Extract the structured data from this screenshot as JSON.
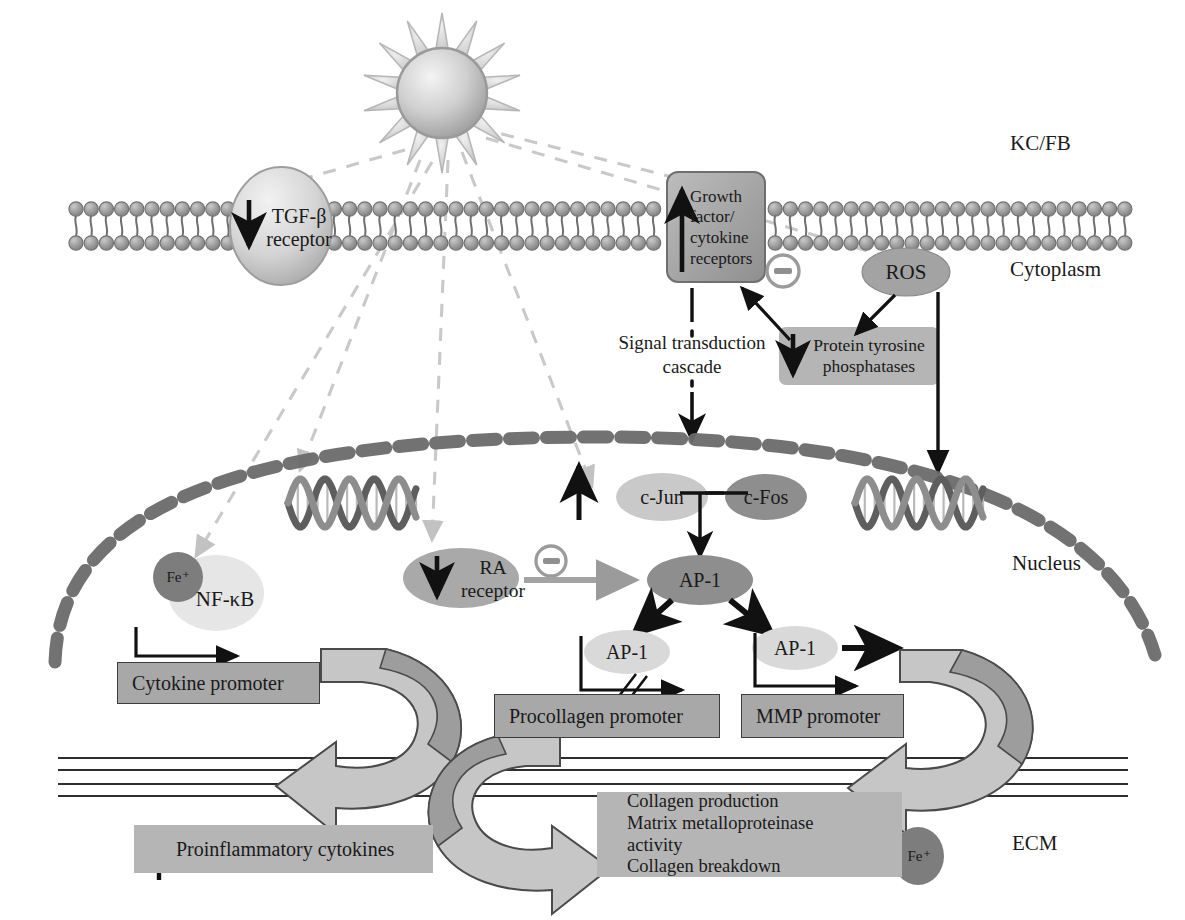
{
  "diagram": {
    "compartments": [
      {
        "id": "kcfb",
        "label": "KC/FB",
        "x": 1010,
        "y": 132
      },
      {
        "id": "cytoplasm",
        "label": "Cytoplasm",
        "x": 1010,
        "y": 258
      },
      {
        "id": "nucleus",
        "label": "Nucleus",
        "x": 1012,
        "y": 552
      },
      {
        "id": "ecm",
        "label": "ECM",
        "x": 1012,
        "y": 832
      }
    ],
    "sun": {
      "name": "uv-sun",
      "rays": 14
    },
    "membrane_receptors": [
      {
        "id": "tgfb",
        "label": "TGF-β\nreceptor",
        "lines": [
          "TGF-β",
          "receptor"
        ],
        "arrow": "down"
      },
      {
        "id": "gfr",
        "label": "Growth factor/cytokine receptors",
        "lines": [
          "Growth",
          "factor/",
          "cytokine",
          "receptors"
        ],
        "arrow": "up"
      }
    ],
    "cytoplasm_nodes": [
      {
        "id": "ros",
        "label": "ROS",
        "shape": "ellipse"
      },
      {
        "id": "ptp",
        "label": "Protein tyrosine phosphatases",
        "lines": [
          "Protein tyrosine",
          "phosphatases"
        ],
        "arrow": "down",
        "shape": "box"
      },
      {
        "id": "cascade",
        "label": "Signal transduction cascade",
        "lines": [
          "Signal transduction",
          "cascade"
        ],
        "shape": "text"
      }
    ],
    "nucleus_nodes": [
      {
        "id": "cjun",
        "label": "c-Jun",
        "arrow": "up"
      },
      {
        "id": "cfos",
        "label": "c-Fos"
      },
      {
        "id": "ap1_main",
        "label": "AP-1"
      },
      {
        "id": "ap1_left",
        "label": "AP-1"
      },
      {
        "id": "ap1_right",
        "label": "AP-1"
      },
      {
        "id": "ra",
        "label": "RA receptor",
        "lines": [
          "RA",
          "receptor"
        ],
        "arrow": "down"
      },
      {
        "id": "nfkb",
        "label": "NF-κB"
      },
      {
        "id": "fe_nucleus",
        "label": "Fe⁺"
      }
    ],
    "promoters": [
      {
        "id": "cytokine_promoter",
        "label": "Cytokine promoter"
      },
      {
        "id": "procollagen_promoter",
        "label": "Procollagen promoter"
      },
      {
        "id": "mmp_promoter",
        "label": "MMP promoter"
      }
    ],
    "outputs": [
      {
        "id": "proinflammatory",
        "label": "Proinflammatory cytokines",
        "arrow": "up"
      },
      {
        "id": "ecm_effects",
        "arrow": "down",
        "lines": [
          "Collagen production",
          "Matrix metalloproteinase",
          "activity",
          "Collagen breakdown"
        ]
      },
      {
        "id": "fe_ecm",
        "label": "Fe⁺"
      }
    ],
    "symbols": [
      {
        "id": "inhibit_ptp",
        "label": "⊖",
        "meaning": "inhibition"
      },
      {
        "id": "inhibit_ra",
        "label": "⊖",
        "meaning": "inhibition"
      }
    ],
    "dna_helices": [
      {
        "id": "dna-left"
      },
      {
        "id": "dna-right"
      }
    ],
    "colors": {
      "mid_gray": "#949494",
      "dark_gray": "#6e6e6e",
      "light_gray": "#d3d3d3",
      "pale_gray": "#e2e2e2",
      "box_gray": "#a8a8a8",
      "outline": "#3d3d3d",
      "envelope": "#6a6a6a",
      "uv_ray": "#c9c9c9",
      "black": "#111111"
    }
  }
}
